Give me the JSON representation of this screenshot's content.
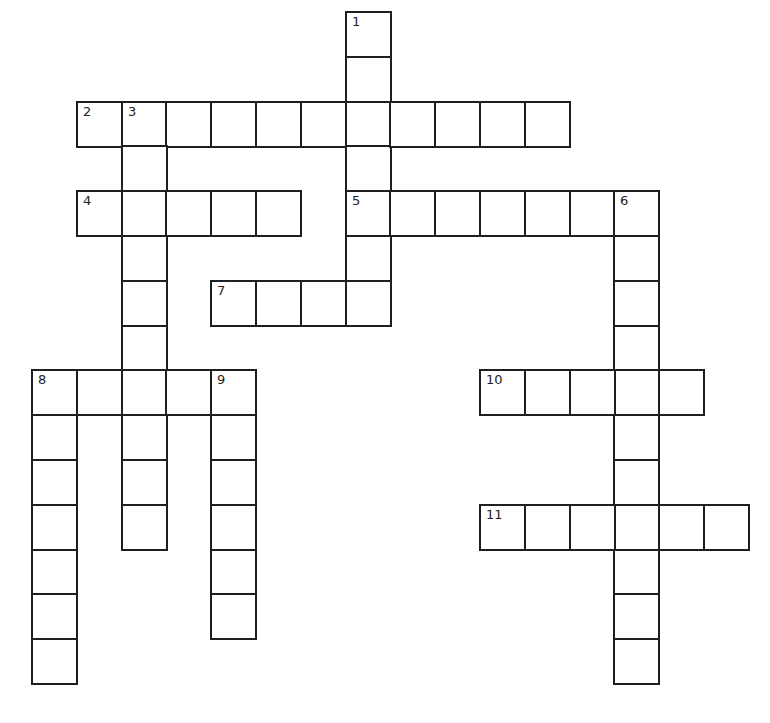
{
  "puzzle": {
    "type": "crossword",
    "grid": {
      "origin_x": 32,
      "origin_y": 12,
      "cell_size": 44.8,
      "border_color": "#1f1f1f"
    },
    "entries": [
      {
        "number": "1",
        "direction": "down",
        "row": 0,
        "col": 7,
        "length": 7
      },
      {
        "number": "2",
        "direction": "across",
        "row": 2,
        "col": 1,
        "length": 11
      },
      {
        "number": "3",
        "direction": "down",
        "row": 2,
        "col": 2,
        "length": 10
      },
      {
        "number": "4",
        "direction": "across",
        "row": 4,
        "col": 1,
        "length": 5
      },
      {
        "number": "5",
        "direction": "across",
        "row": 4,
        "col": 7,
        "length": 7
      },
      {
        "number": "6",
        "direction": "down",
        "row": 4,
        "col": 13,
        "length": 11
      },
      {
        "number": "7",
        "direction": "across",
        "row": 6,
        "col": 4,
        "length": 4
      },
      {
        "number": "8",
        "direction": "across",
        "row": 8,
        "col": 0,
        "length": 5
      },
      {
        "number": "8",
        "direction": "down",
        "row": 8,
        "col": 0,
        "length": 7
      },
      {
        "number": "9",
        "direction": "down",
        "row": 8,
        "col": 4,
        "length": 6
      },
      {
        "number": "10",
        "direction": "across",
        "row": 8,
        "col": 10,
        "length": 5
      },
      {
        "number": "11",
        "direction": "across",
        "row": 11,
        "col": 10,
        "length": 6
      }
    ]
  }
}
